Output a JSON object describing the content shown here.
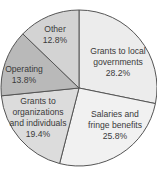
{
  "chart_data": {
    "type": "pie",
    "title": "",
    "start_angle_deg": 0,
    "direction": "clockwise",
    "slices": [
      {
        "label": "Grants to local governments",
        "label_lines": [
          "Grants to local",
          "governments",
          "28.2%"
        ],
        "value": 28.2,
        "color": "#ececec",
        "label_pos": [
          118,
          62
        ]
      },
      {
        "label": "Salaries and fringe benefits",
        "label_lines": [
          "Salaries and",
          "fringe benefits",
          "25.8%"
        ],
        "value": 25.8,
        "color": "#f1f1f1",
        "label_pos": [
          115,
          125
        ]
      },
      {
        "label": "Grants to organizations and individuals",
        "label_lines": [
          "Grants to",
          "organizations",
          "and individuals",
          "19.4%"
        ],
        "value": 19.4,
        "color": "#dcdcdc",
        "label_pos": [
          38,
          118
        ]
      },
      {
        "label": "Operating",
        "label_lines": [
          "Operating",
          "13.8%"
        ],
        "value": 13.8,
        "color": "#b9b9b9",
        "label_pos": [
          24,
          75
        ]
      },
      {
        "label": "Other",
        "label_lines": [
          "Other",
          "12.8%"
        ],
        "value": 12.8,
        "color": "#d3d3d3",
        "label_pos": [
          55,
          35
        ]
      }
    ],
    "value_format": "percent",
    "legend": "none"
  },
  "geometry": {
    "cx": 79,
    "cy": 88,
    "r": 78,
    "stroke": "#555555"
  }
}
